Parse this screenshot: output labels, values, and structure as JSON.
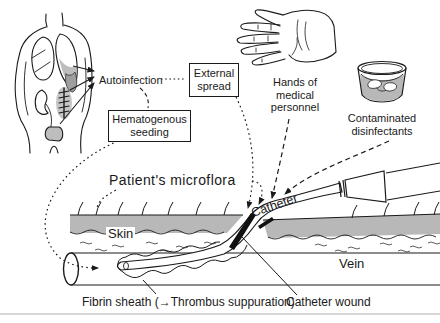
{
  "diagram": {
    "labels": {
      "autoinfection": "Autoinfection",
      "external_spread": "External\nspread",
      "hands_of_medical_personnel": "Hands of\nmedical\npersonnel",
      "contaminated_disinfectants": "Contaminated\ndisinfectants",
      "hematogenous_seeding": "Hematogenous\nseeding",
      "patients_microflora": "Patient's microflora",
      "skin": "Skin",
      "catheter": "Catheter",
      "vein": "Vein",
      "fibrin_sheath": "Fibrin sheath (→Thrombus suppuration)",
      "catheter_wound": "Catheter wound"
    },
    "illustrations": [
      "torso-organs-illustration",
      "hand-illustration",
      "disinfectant-container-icon",
      "skin-layer",
      "vein-vessel",
      "catheter-tube",
      "catheter-hub",
      "fibrin-sheath-texture",
      "catheter-wound-streak"
    ],
    "colors": {
      "line": "#1a1a1a",
      "skin_gray": "#b8b8b8",
      "organ_gray": "#bdbdbd",
      "dark_gray": "#9e9e9e",
      "page_rule": "#c9c9c9"
    }
  }
}
